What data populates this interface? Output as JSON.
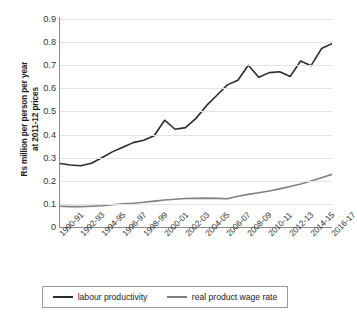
{
  "chart_data": {
    "type": "line",
    "title": "",
    "xlabel": "",
    "ylabel": "Rs million per person per year at 2011-12 prices",
    "ylabel_line1": "Rs million per person per year",
    "ylabel_line2": "at 2011-12 prices",
    "ylim": [
      0,
      0.9
    ],
    "ytick_labels": [
      "0.9",
      "0.8",
      "0.7",
      "0.6",
      "0.5",
      "0.4",
      "0.3",
      "0.2",
      "0.1",
      "0"
    ],
    "ytick_values": [
      0.9,
      0.8,
      0.7,
      0.6,
      0.5,
      0.4,
      0.3,
      0.2,
      0.1,
      0
    ],
    "grid": true,
    "legend_position": "bottom",
    "x": [
      "1990-91",
      "1991-92",
      "1992-93",
      "1993-94",
      "1994-95",
      "1995-96",
      "1996-97",
      "1997-98",
      "1998-99",
      "1999-00",
      "2000-01",
      "2001-02",
      "2002-03",
      "2003-04",
      "2004-05",
      "2005-06",
      "2006-07",
      "2007-08",
      "2008-09",
      "2009-10",
      "2010-11",
      "2011-12",
      "2012-13",
      "2013-14",
      "2014-15",
      "2015-16",
      "2016-17"
    ],
    "xtick_labels": [
      "1990-91",
      "1992-93",
      "1994-95",
      "1996-97",
      "1998-99",
      "2000-01",
      "2002-03",
      "2004-05",
      "2006-07",
      "2008-09",
      "2010-11",
      "2012-13",
      "2014-15",
      "2016-17"
    ],
    "series": [
      {
        "name": "labour productivity",
        "color": "#2b2b2b",
        "values": [
          0.275,
          0.268,
          0.265,
          0.276,
          0.3,
          0.325,
          0.345,
          0.365,
          0.375,
          0.395,
          0.462,
          0.423,
          0.43,
          0.47,
          0.525,
          0.57,
          0.615,
          0.635,
          0.7,
          0.648,
          0.668,
          0.672,
          0.651,
          0.718,
          0.698,
          0.772,
          0.793
        ]
      },
      {
        "name": "real product wage rate",
        "color": "#808080",
        "values": [
          0.09,
          0.088,
          0.088,
          0.09,
          0.092,
          0.096,
          0.1,
          0.103,
          0.107,
          0.112,
          0.117,
          0.12,
          0.123,
          0.124,
          0.125,
          0.124,
          0.122,
          0.133,
          0.141,
          0.148,
          0.156,
          0.165,
          0.175,
          0.186,
          0.199,
          0.213,
          0.228
        ]
      }
    ]
  },
  "legend": {
    "items": [
      {
        "label": "labour productivity",
        "color": "#2b2b2b"
      },
      {
        "label": "real product wage rate",
        "color": "#808080"
      }
    ]
  }
}
